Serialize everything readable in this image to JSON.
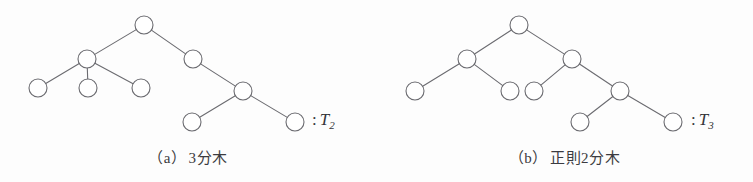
{
  "figure": {
    "background_color": "#fdfdfd",
    "stroke_color": "#6b6b70",
    "node_fill": "#ffffff",
    "text_color": "#3b3b40",
    "node_radius": 9,
    "stroke_width": 1.1
  },
  "panels": [
    {
      "id": "a",
      "caption_tag": "（a）",
      "caption_text": "3分木",
      "label_colon": ":",
      "label_symbol": "T",
      "label_subscript": "2",
      "tree": {
        "description": "3-ary tree",
        "nodes": [
          {
            "id": "a-root",
            "name": "root-node",
            "cx": 144,
            "cy": 25
          },
          {
            "id": "a-n1",
            "name": "internal-node-left",
            "cx": 87,
            "cy": 59
          },
          {
            "id": "a-n2",
            "name": "internal-node-right",
            "cx": 193,
            "cy": 59
          },
          {
            "id": "a-l1",
            "name": "leaf-node-1",
            "cx": 38,
            "cy": 88
          },
          {
            "id": "a-l2",
            "name": "leaf-node-2",
            "cx": 88,
            "cy": 88
          },
          {
            "id": "a-l3",
            "name": "leaf-node-3",
            "cx": 141,
            "cy": 88
          },
          {
            "id": "a-n3",
            "name": "internal-node-lower",
            "cx": 243,
            "cy": 91
          },
          {
            "id": "a-l4",
            "name": "leaf-node-4",
            "cx": 192,
            "cy": 122
          },
          {
            "id": "a-l5",
            "name": "leaf-node-5",
            "cx": 295,
            "cy": 122
          }
        ],
        "edges": [
          {
            "from": "a-root",
            "to": "a-n1"
          },
          {
            "from": "a-root",
            "to": "a-n2"
          },
          {
            "from": "a-n1",
            "to": "a-l1"
          },
          {
            "from": "a-n1",
            "to": "a-l2"
          },
          {
            "from": "a-n1",
            "to": "a-l3"
          },
          {
            "from": "a-n2",
            "to": "a-n3"
          },
          {
            "from": "a-n3",
            "to": "a-l4"
          },
          {
            "from": "a-n3",
            "to": "a-l5"
          }
        ]
      }
    },
    {
      "id": "b",
      "caption_tag": "（b）",
      "caption_text": "正則2分木",
      "label_colon": ":",
      "label_symbol": "T",
      "label_subscript": "3",
      "tree": {
        "description": "regular binary tree",
        "nodes": [
          {
            "id": "b-root",
            "name": "root-node",
            "cx": 519,
            "cy": 25
          },
          {
            "id": "b-n1",
            "name": "internal-node-left",
            "cx": 467,
            "cy": 59
          },
          {
            "id": "b-n2",
            "name": "internal-node-right",
            "cx": 572,
            "cy": 59
          },
          {
            "id": "b-l1",
            "name": "leaf-node-1",
            "cx": 415,
            "cy": 91
          },
          {
            "id": "b-l2",
            "name": "leaf-node-2",
            "cx": 510,
            "cy": 91
          },
          {
            "id": "b-l3",
            "name": "leaf-node-3",
            "cx": 534,
            "cy": 91
          },
          {
            "id": "b-n3",
            "name": "internal-node-lower",
            "cx": 620,
            "cy": 91
          },
          {
            "id": "b-l4",
            "name": "leaf-node-4",
            "cx": 580,
            "cy": 122
          },
          {
            "id": "b-l5",
            "name": "leaf-node-5",
            "cx": 673,
            "cy": 122
          }
        ],
        "edges": [
          {
            "from": "b-root",
            "to": "b-n1"
          },
          {
            "from": "b-root",
            "to": "b-n2"
          },
          {
            "from": "b-n1",
            "to": "b-l1"
          },
          {
            "from": "b-n1",
            "to": "b-l2"
          },
          {
            "from": "b-n2",
            "to": "b-l3"
          },
          {
            "from": "b-n2",
            "to": "b-n3"
          },
          {
            "from": "b-n3",
            "to": "b-l4"
          },
          {
            "from": "b-n3",
            "to": "b-l5"
          }
        ]
      }
    }
  ]
}
